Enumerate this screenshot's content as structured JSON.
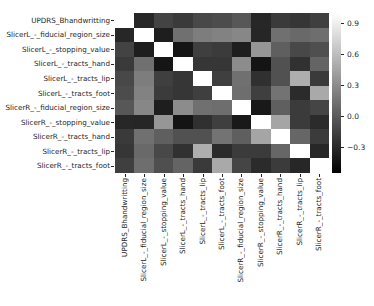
{
  "figure": {
    "background": "#ffffff",
    "text_color": "#262626"
  },
  "chart_data": {
    "type": "heatmap",
    "title": "",
    "xlabel": "",
    "ylabel": "",
    "colormap": "gray",
    "grid": false,
    "vmin": -0.55,
    "vmax": 1.0,
    "labels": [
      "UPDRS_Bhandwritting",
      "SlicerL_-_fiducial_region_size",
      "SlicerL_-_stopping_value",
      "SlicerL_-_tracts_hand",
      "SlicerL_-_tracts_lip",
      "SlicerL_-_tracts_foot",
      "SlicerR_-_fiducial_region_size",
      "SlicerR_-_stopping_value",
      "SlicerR_-_tracts_hand",
      "SlicerR_-_tracts_lip",
      "SlicerR_-_tracts_foot"
    ],
    "matrix": [
      [
        1.0,
        -0.31,
        -0.14,
        -0.2,
        -0.11,
        -0.09,
        -0.02,
        -0.31,
        -0.2,
        -0.22,
        -0.17
      ],
      [
        -0.31,
        1.0,
        -0.37,
        0.13,
        0.21,
        0.24,
        0.27,
        -0.32,
        0.13,
        0.09,
        0.12
      ],
      [
        -0.14,
        -0.37,
        1.0,
        -0.42,
        -0.17,
        -0.19,
        -0.37,
        0.36,
        0.03,
        -0.11,
        -0.07
      ],
      [
        -0.2,
        0.13,
        -0.42,
        1.0,
        -0.22,
        -0.22,
        0.3,
        -0.43,
        -0.06,
        -0.25,
        0.06
      ],
      [
        -0.11,
        0.21,
        -0.17,
        -0.22,
        1.0,
        -0.17,
        0.13,
        -0.26,
        -0.06,
        0.51,
        -0.2
      ],
      [
        -0.09,
        0.24,
        -0.19,
        -0.22,
        -0.17,
        1.0,
        0.12,
        -0.17,
        0.15,
        -0.29,
        0.48
      ],
      [
        -0.02,
        0.27,
        -0.37,
        0.3,
        0.13,
        0.12,
        1.0,
        -0.4,
        0.03,
        -0.19,
        -0.13
      ],
      [
        -0.31,
        -0.32,
        0.36,
        -0.43,
        -0.26,
        -0.17,
        -0.4,
        1.0,
        0.45,
        -0.19,
        -0.29
      ],
      [
        -0.2,
        0.13,
        0.03,
        -0.06,
        -0.06,
        0.15,
        0.03,
        0.45,
        1.0,
        0.07,
        -0.19
      ],
      [
        -0.22,
        0.09,
        -0.11,
        -0.25,
        0.51,
        -0.29,
        -0.19,
        -0.19,
        0.07,
        1.0,
        -0.31
      ],
      [
        -0.17,
        0.12,
        -0.07,
        0.06,
        -0.2,
        0.48,
        -0.13,
        -0.29,
        -0.19,
        -0.31,
        1.0
      ]
    ],
    "legend": "none",
    "colorbar": {
      "position": "right",
      "tick_values": [
        0.9,
        0.6,
        0.3,
        0.0,
        -0.3
      ],
      "tick_labels": [
        "0.9",
        "0.6",
        "0.3",
        "0.0",
        "−0.3"
      ]
    }
  }
}
